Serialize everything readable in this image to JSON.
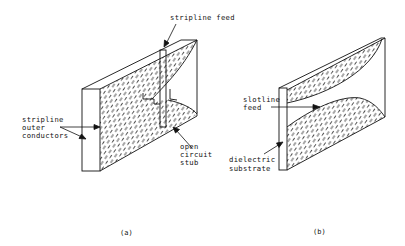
{
  "figure": {
    "panel_a": {
      "caption": "(a)",
      "labels": {
        "stripline_feed": "stripline feed",
        "outer_conductors_line1": "stripline",
        "outer_conductors_line2": "outer",
        "outer_conductors_line3": "conductors",
        "stub_line1": "open",
        "stub_line2": "circuit",
        "stub_line3": "stub"
      }
    },
    "panel_b": {
      "caption": "(b)",
      "labels": {
        "slotline_line1": "slotline",
        "slotline_line2": "feed",
        "substrate_line1": "dielectric",
        "substrate_line2": "substrate"
      }
    },
    "colors": {
      "ink": "#111111",
      "background": "#ffffff"
    }
  }
}
